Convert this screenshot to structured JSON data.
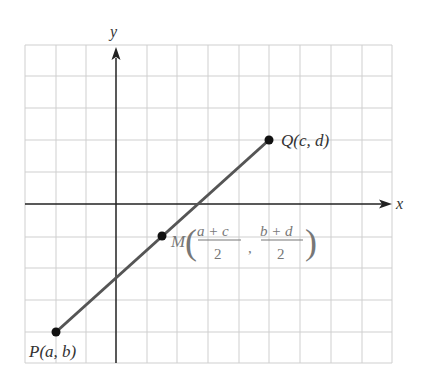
{
  "diagram": {
    "axes": {
      "x_label": "x",
      "y_label": "y"
    },
    "grid": {
      "cols": 12,
      "rows": 10
    },
    "points": [
      {
        "id": "P",
        "label": "P(a, b)"
      },
      {
        "id": "Q",
        "label": "Q(c, d)"
      },
      {
        "id": "M",
        "label": "M",
        "x_num": "a + c",
        "x_den": "2",
        "y_num": "b + d",
        "y_den": "2",
        "sep": ","
      }
    ]
  },
  "colors": {
    "grid": "#c8c8c8",
    "axis": "#222222",
    "segment": "#555555",
    "point": "#111111",
    "midpoint_label": "#777777"
  }
}
